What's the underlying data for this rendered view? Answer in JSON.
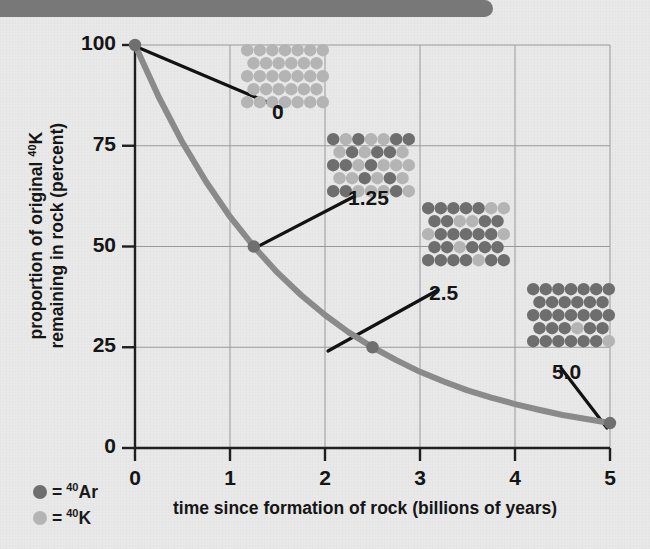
{
  "chart_data": {
    "type": "line",
    "title": "",
    "xlabel": "time since formation of rock (billions of years)",
    "ylabel_line1": "proportion of original ",
    "ylabel_sup1": "40",
    "ylabel_mid": "K",
    "ylabel_line2": "remaining in rock (percent)",
    "xlim": [
      0,
      5
    ],
    "ylim": [
      0,
      100
    ],
    "x_ticks": [
      "0",
      "1",
      "2",
      "3",
      "4",
      "5"
    ],
    "y_ticks": [
      "0",
      "25",
      "50",
      "75",
      "100"
    ],
    "grid": true,
    "half_life_billion_years": 1.25,
    "series": [
      {
        "name": "40K remaining",
        "x": [
          0,
          0.25,
          0.5,
          0.75,
          1.0,
          1.25,
          1.5,
          1.75,
          2.0,
          2.25,
          2.5,
          2.75,
          3.0,
          3.25,
          3.5,
          3.75,
          4.0,
          4.25,
          4.5,
          4.75,
          5.0
        ],
        "y": [
          100,
          87.1,
          75.8,
          66.0,
          57.4,
          50.0,
          43.5,
          37.9,
          33.0,
          28.7,
          25.0,
          21.8,
          18.9,
          16.5,
          14.3,
          12.5,
          10.9,
          9.5,
          8.2,
          7.2,
          6.2
        ]
      }
    ],
    "markers": [
      {
        "x": 0,
        "y": 100,
        "label": "0"
      },
      {
        "x": 1.25,
        "y": 50,
        "label": "1.25"
      },
      {
        "x": 2.5,
        "y": 25,
        "label": "2.5"
      },
      {
        "x": 5.0,
        "y": 6.2,
        "label": "5.0"
      }
    ],
    "annotations": [
      {
        "label": "0",
        "time": 0,
        "k_fraction": 1.0,
        "ar_fraction": 0.0
      },
      {
        "label": "1.25",
        "time": 1.25,
        "k_fraction": 0.5,
        "ar_fraction": 0.5
      },
      {
        "label": "2.5",
        "time": 2.5,
        "k_fraction": 0.25,
        "ar_fraction": 0.75
      },
      {
        "label": "5.0",
        "time": 5.0,
        "k_fraction": 0.06,
        "ar_fraction": 0.94
      }
    ],
    "colors": {
      "curve": "#8a8a8a",
      "ar_dot": "#6e6e6e",
      "k_dot": "#b4b4b4",
      "axis": "#1f1f1f",
      "grid": "#9a9a9a",
      "background": "#e9e9e9",
      "banner": "#787878"
    }
  },
  "legend": {
    "items": [
      {
        "symbol_color": "#6e6e6e",
        "equals": "=",
        "sup": "40",
        "element": "Ar"
      },
      {
        "symbol_color": "#b4b4b4",
        "equals": "=",
        "sup": "40",
        "element": "K"
      }
    ]
  }
}
